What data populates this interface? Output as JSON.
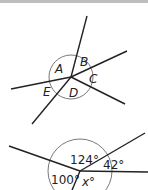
{
  "diagram1": {
    "labels": {
      "A": "A",
      "B": "B",
      "C": "C",
      "D": "D",
      "E": "E"
    }
  },
  "diagram2": {
    "angles": {
      "top": "124°",
      "right": "42°",
      "left": "100°",
      "bottom": "x°"
    }
  }
}
